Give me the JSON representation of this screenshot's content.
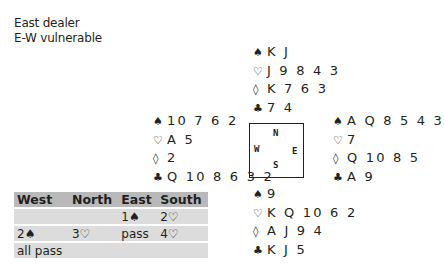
{
  "info": {
    "dealer": "East dealer",
    "vulnerability": "E-W vulnerable"
  },
  "suits": {
    "spades": "♠",
    "hearts": "♡",
    "diamonds": "◊",
    "clubs": "♣"
  },
  "hands": {
    "north": {
      "spades": "K J",
      "hearts": "J 9 8 4 3",
      "diamonds": "K 7 6 3",
      "clubs": "7 4"
    },
    "west": {
      "spades": "10 7 6 2",
      "hearts": "A 5",
      "diamonds": "2",
      "clubs": "Q 10 8 6 3 2"
    },
    "east": {
      "spades": "A Q 8 5 4 3",
      "hearts": "7",
      "diamonds": "Q 10 8 5",
      "clubs": "A 9"
    },
    "south": {
      "spades": "9",
      "hearts": "K Q 10 6 2",
      "diamonds": "A J 9 4",
      "clubs": "K J 5"
    }
  },
  "compass": {
    "n": "N",
    "s": "S",
    "w": "W",
    "e": "E"
  },
  "auction": {
    "headers": [
      "West",
      "North",
      "East",
      "South"
    ],
    "rows": [
      [
        "",
        "",
        "1♠",
        "2♡"
      ],
      [
        "2♠",
        "3♡",
        "pass",
        "4♡"
      ],
      [
        "all pass",
        "",
        "",
        ""
      ]
    ]
  }
}
